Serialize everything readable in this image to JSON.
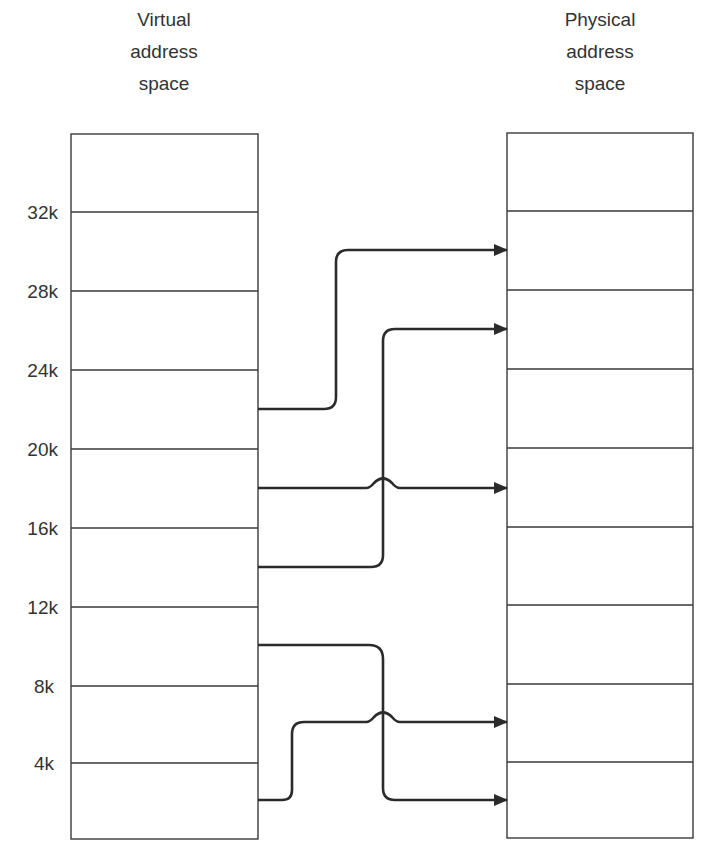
{
  "diagram": {
    "virtual": {
      "title_lines": [
        "Virtual",
        "address",
        "space"
      ],
      "ticks": [
        "32k",
        "28k",
        "24k",
        "20k",
        "16k",
        "12k",
        "8k",
        "4k"
      ],
      "pages": 9
    },
    "physical": {
      "title_lines": [
        "Physical",
        "address",
        "space"
      ],
      "pages": 9
    },
    "mappings": [
      {
        "from": "20k-24k",
        "to": "physical frame 2 from top"
      },
      {
        "from": "16k-20k",
        "to": "physical frame 5 from top"
      },
      {
        "from": "12k-16k",
        "to": "physical frame 3 from top"
      },
      {
        "from": "8k-12k",
        "to": "physical frame 9 from top"
      },
      {
        "from": "0k-4k",
        "to": "physical frame 8 from top"
      }
    ],
    "colors": {
      "line": "#2b2b2b",
      "background": "#ffffff"
    }
  }
}
